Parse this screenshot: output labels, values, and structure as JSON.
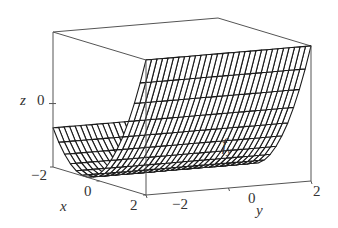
{
  "figure": {
    "surface_label": "f",
    "surface_label_sub": "y",
    "axes": {
      "x": {
        "label": "x",
        "ticks": [
          "-2",
          "0",
          "2"
        ],
        "range": [
          -2,
          2
        ]
      },
      "y": {
        "label": "y",
        "ticks": [
          "-2",
          "0",
          "2"
        ],
        "range": [
          -2,
          2
        ]
      },
      "z": {
        "label": "z",
        "ticks": [
          "0"
        ]
      }
    },
    "colors": {
      "mesh": "#1a1a1a",
      "box": "#555555",
      "text": "#333333",
      "background": "#ffffff"
    }
  },
  "chart_data": {
    "type": "surface",
    "xlabel": "x",
    "ylabel": "y",
    "zlabel": "z",
    "x_ticks": [
      -2,
      0,
      2
    ],
    "y_ticks": [
      -2,
      0,
      2
    ],
    "z_ticks": [
      0
    ],
    "xlim": [
      -2,
      2
    ],
    "ylim": [
      -2,
      2
    ],
    "grid": {
      "nx": 16,
      "ny": 30
    }
  }
}
